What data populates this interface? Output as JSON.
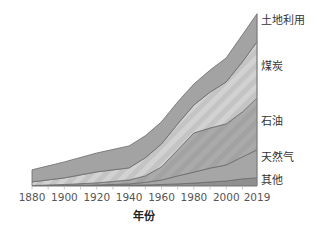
{
  "chart_data": {
    "type": "area",
    "stacked": true,
    "title": "",
    "xlabel": "年份",
    "ylabel": "",
    "x": [
      1880,
      1900,
      1920,
      1940,
      1950,
      1960,
      1970,
      1980,
      1990,
      2000,
      2010,
      2019
    ],
    "x_ticks": [
      "1880",
      "1900",
      "1920",
      "1940",
      "1960",
      "1980",
      "2000",
      "2019"
    ],
    "xlim": [
      1880,
      2019
    ],
    "units": "relative (2019 total = 100)",
    "series": [
      {
        "name": "其他",
        "color": "#8e8e8e",
        "values": [
          0.0,
          0.0,
          0.3,
          0.6,
          0.6,
          0.9,
          1.2,
          1.7,
          2.3,
          2.9,
          4.1,
          4.7
        ]
      },
      {
        "name": "天然气",
        "color": "#a9a9a9",
        "values": [
          0.0,
          0.3,
          0.3,
          0.6,
          1.5,
          2.6,
          4.7,
          6.4,
          8.1,
          9.3,
          12.8,
          16.3
        ]
      },
      {
        "name": "石油",
        "color": "#9c9c9c",
        "values": [
          0.3,
          0.6,
          1.2,
          2.3,
          3.8,
          7.6,
          15.1,
          22.7,
          23.3,
          23.9,
          26.2,
          30.2
        ]
      },
      {
        "name": "煤炭",
        "color": "#c8c8c8",
        "values": [
          2.1,
          3.8,
          6.4,
          7.0,
          10.5,
          13.4,
          15.1,
          16.3,
          20.9,
          24.4,
          29.1,
          32.6
        ]
      },
      {
        "name": "土地利用",
        "color": "#a0a0a0",
        "values": [
          7.0,
          9.3,
          11.0,
          12.8,
          12.8,
          12.8,
          12.8,
          12.2,
          12.8,
          14.0,
          15.7,
          16.3
        ]
      }
    ],
    "legend_position": "right (inline labels)",
    "grid": false
  },
  "labels": {
    "land": "土地利用",
    "coal": "煤炭",
    "oil": "石油",
    "gas": "天然气",
    "other": "其他"
  },
  "ticks": [
    "1880",
    "1900",
    "1920",
    "1940",
    "1960",
    "1980",
    "2000",
    "2019"
  ],
  "xlabel": "年份"
}
